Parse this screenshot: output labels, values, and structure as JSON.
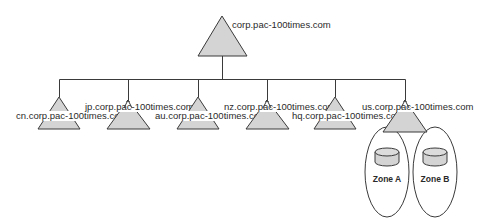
{
  "diagram": {
    "type": "domain-tree",
    "colors": {
      "line": "#3a3a3a",
      "fill": "#d4d4d4",
      "background": "#ffffff"
    },
    "root": {
      "label": "corp.pac-100times.com",
      "icon": "triangle-domain-icon"
    },
    "children": [
      {
        "label": "cn.corp.pac-100times.com",
        "icon": "triangle-domain-icon"
      },
      {
        "label": "jp.corp.pac-100times.com",
        "icon": "triangle-domain-icon"
      },
      {
        "label": "au.corp.pac-100times.com",
        "icon": "triangle-domain-icon"
      },
      {
        "label": "nz.corp.pac-100times.com",
        "icon": "triangle-domain-icon"
      },
      {
        "label": "hq.corp.pac-100times.com",
        "icon": "triangle-domain-icon"
      },
      {
        "label": "us.corp.pac-100times.com",
        "icon": "triangle-domain-icon"
      }
    ],
    "zones": [
      {
        "label": "Zone A",
        "icon": "database-cylinder-icon"
      },
      {
        "label": "Zone B",
        "icon": "database-cylinder-icon"
      }
    ]
  }
}
